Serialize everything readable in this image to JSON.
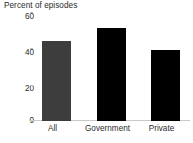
{
  "chart_data": {
    "type": "bar",
    "title": "Percent of episodes",
    "xlabel": "",
    "ylabel": "",
    "categories": [
      "All",
      "Government",
      "Private"
    ],
    "values": [
      44,
      51,
      39
    ],
    "series": [
      {
        "name": "Percent of episodes",
        "values": [
          44,
          51,
          39
        ]
      }
    ],
    "ylim": [
      0,
      60
    ],
    "yticks": [
      0,
      20,
      40,
      60
    ],
    "ytick_labels": [
      "0",
      "20",
      "40",
      "60"
    ],
    "grid": false,
    "legend": false,
    "legend_position": "none",
    "bar_colors": [
      "#3d3d3d",
      "#000000",
      "#000000"
    ],
    "axis_color": "#c9c9c9",
    "text_color": "#2b2b2b",
    "background": "#ffffff"
  }
}
